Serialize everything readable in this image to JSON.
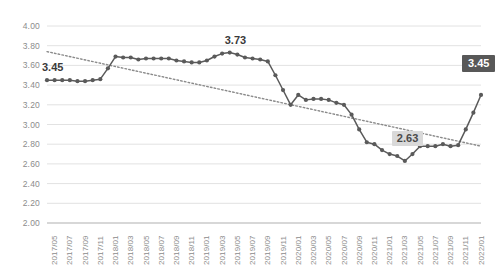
{
  "chart_data": {
    "type": "line",
    "title": "",
    "xlabel": "",
    "ylabel": "",
    "ylim": [
      2.0,
      4.0
    ],
    "ytick_step": 0.2,
    "ytick_labels": [
      "4.00",
      "3.80",
      "3.60",
      "3.40",
      "3.20",
      "3.00",
      "2.80",
      "2.60",
      "2.40",
      "2.20",
      "2.00"
    ],
    "grid": true,
    "legend": "none",
    "x_tick_interval_months": 2,
    "tick_labels": [
      "2017/05",
      "2017/07",
      "2017/09",
      "2017/11",
      "2018/01",
      "2018/03",
      "2018/05",
      "2018/07",
      "2018/09",
      "2018/11",
      "2019/01",
      "2019/03",
      "2019/05",
      "2019/07",
      "2019/09",
      "2019/11",
      "2020/01",
      "2020/03",
      "2020/05",
      "2020/07",
      "2020/09",
      "2020/11",
      "2021/01",
      "2021/03",
      "2021/05",
      "2021/07",
      "2021/09",
      "2021/11",
      "2022/01"
    ],
    "x": [
      "2017/05",
      "2017/06",
      "2017/07",
      "2017/08",
      "2017/09",
      "2017/10",
      "2017/11",
      "2017/12",
      "2018/01",
      "2018/02",
      "2018/03",
      "2018/04",
      "2018/05",
      "2018/06",
      "2018/07",
      "2018/08",
      "2018/09",
      "2018/10",
      "2018/11",
      "2018/12",
      "2019/01",
      "2019/02",
      "2019/03",
      "2019/04",
      "2019/05",
      "2019/06",
      "2019/07",
      "2019/08",
      "2019/09",
      "2019/10",
      "2019/11",
      "2019/12",
      "2020/01",
      "2020/02",
      "2020/03",
      "2020/04",
      "2020/05",
      "2020/06",
      "2020/07",
      "2020/08",
      "2020/09",
      "2020/10",
      "2020/11",
      "2020/12",
      "2021/01",
      "2021/02",
      "2021/03",
      "2021/04",
      "2021/05",
      "2021/06",
      "2021/07",
      "2021/08",
      "2021/09",
      "2021/10",
      "2021/11",
      "2021/12",
      "2022/01",
      "2022/02"
    ],
    "series": [
      {
        "name": "value",
        "color": "#5a5a5a",
        "marker": "circle",
        "values": [
          3.45,
          3.45,
          3.45,
          3.45,
          3.44,
          3.44,
          3.45,
          3.46,
          3.57,
          3.69,
          3.68,
          3.68,
          3.66,
          3.67,
          3.67,
          3.67,
          3.67,
          3.65,
          3.64,
          3.63,
          3.63,
          3.65,
          3.69,
          3.72,
          3.73,
          3.71,
          3.68,
          3.67,
          3.66,
          3.64,
          3.5,
          3.35,
          3.2,
          3.3,
          3.25,
          3.26,
          3.26,
          3.25,
          3.22,
          3.2,
          3.1,
          2.95,
          2.82,
          2.8,
          2.74,
          2.7,
          2.68,
          2.63,
          2.7,
          2.78,
          2.78,
          2.78,
          2.8,
          2.78,
          2.79,
          2.95,
          3.12,
          3.3
        ]
      }
    ],
    "trendline": {
      "type": "linear-dotted",
      "color": "#8a8a8a",
      "start_value": 3.74,
      "end_value": 2.78
    },
    "annotations": [
      {
        "label": "3.45",
        "style": "plain",
        "x": "2017/05",
        "value": 3.45
      },
      {
        "label": "3.73",
        "style": "plain",
        "x": "2019/05",
        "value": 3.73
      },
      {
        "label": "2.63",
        "style": "boxed-light",
        "x": "2021/04",
        "value": 2.63
      },
      {
        "label": "3.45",
        "style": "boxed-dark",
        "x": "2022/02",
        "value": 3.45
      }
    ]
  },
  "colors": {
    "series": "#5a5a5a",
    "trendline": "#8a8a8a",
    "gridline": "#e2e2e2",
    "axis": "#bdbdbd",
    "tick_text": "#8c8c8c",
    "annot_dark_bg": "#585858",
    "annot_light_bg": "#d9d9d9"
  }
}
